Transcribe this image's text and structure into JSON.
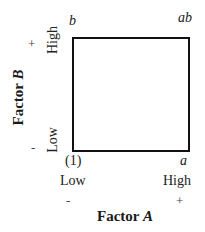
{
  "diagram": {
    "type": "2x2 factorial design square",
    "corners": {
      "top_left": "b",
      "top_right": "ab",
      "bottom_left": "(1)",
      "bottom_right": "a"
    },
    "x_axis": {
      "title_prefix": "Factor ",
      "title_var": "A",
      "low_label": "Low",
      "high_label": "High",
      "low_sign": "-",
      "high_sign": "+"
    },
    "y_axis": {
      "title_prefix": "Factor ",
      "title_var": "B",
      "low_label": "Low",
      "high_label": "High",
      "low_sign": "-",
      "high_sign": "+"
    },
    "colors": {
      "line": "#111111",
      "text": "#1a1a1a",
      "background": "#ffffff"
    }
  }
}
